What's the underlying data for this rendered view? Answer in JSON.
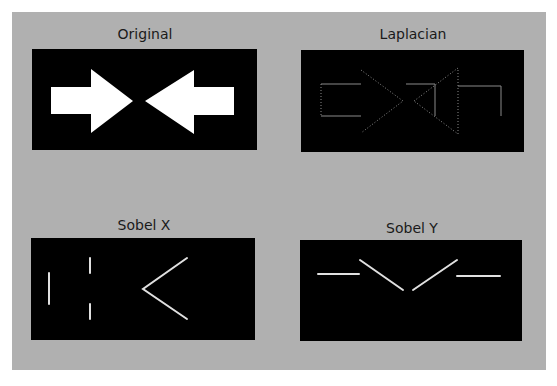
{
  "figure": {
    "background": "#b0b0b0",
    "panels": [
      {
        "title": "Original",
        "content": "two solid white arrows pointing toward each other"
      },
      {
        "title": "Laplacian",
        "content": "thin dotted outlines of both arrows"
      },
      {
        "title": "Sobel X",
        "content": "vertical edges and diagonal chevron edges"
      },
      {
        "title": "Sobel Y",
        "content": "horizontal edges and diagonal V edges"
      }
    ]
  }
}
